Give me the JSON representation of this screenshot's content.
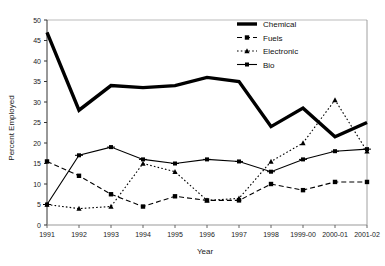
{
  "chart_data": {
    "type": "line",
    "title": "",
    "xlabel": "Year",
    "ylabel": "Percent Employed",
    "categories": [
      "1991",
      "1992",
      "1993",
      "1994",
      "1995",
      "1996",
      "1997",
      "1998",
      "1999-00",
      "2000-01",
      "2001-02"
    ],
    "ylim": [
      0,
      50
    ],
    "yticks": [
      0,
      5,
      10,
      15,
      20,
      25,
      30,
      35,
      40,
      45,
      50
    ],
    "grid": false,
    "legend_position": "top-right",
    "series": [
      {
        "name": "Chemical",
        "style": "solid-thick",
        "marker": "none",
        "color": "#000000",
        "values": [
          47,
          28,
          34,
          33.5,
          34,
          36,
          35,
          24,
          28.5,
          21.5,
          25
        ]
      },
      {
        "name": "Fuels",
        "style": "dashed",
        "marker": "square",
        "color": "#000000",
        "values": [
          15.5,
          12,
          7.5,
          4.5,
          7,
          6,
          6,
          10,
          8.5,
          10.5,
          10.5
        ]
      },
      {
        "name": "Electronic",
        "style": "dotted",
        "marker": "triangle",
        "color": "#000000",
        "values": [
          5,
          4,
          4.5,
          15,
          13,
          6,
          6.5,
          15.5,
          20,
          30.5,
          18
        ]
      },
      {
        "name": "Bio",
        "style": "solid",
        "marker": "cross",
        "color": "#000000",
        "values": [
          5,
          17,
          19,
          16,
          15,
          16,
          15.5,
          13,
          16,
          18,
          18.5
        ]
      }
    ]
  },
  "legend": {
    "items": [
      {
        "label": "Chemical"
      },
      {
        "label": "Fuels"
      },
      {
        "label": "Electronic"
      },
      {
        "label": "Bio"
      }
    ]
  },
  "axes": {
    "y_title": "Percent Employed",
    "x_title": "Year",
    "y_tick_labels": [
      "0",
      "5",
      "10",
      "15",
      "20",
      "25",
      "30",
      "35",
      "40",
      "45",
      "50"
    ],
    "x_tick_labels": [
      "1991",
      "1992",
      "1993",
      "1994",
      "1995",
      "1996",
      "1997",
      "1998",
      "1999-00",
      "2000-01",
      "2001-02"
    ]
  }
}
